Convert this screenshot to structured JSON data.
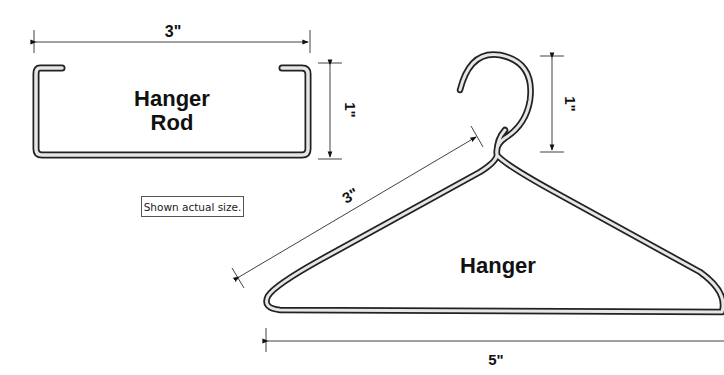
{
  "rod": {
    "title_line1": "Hanger",
    "title_line2": "Rod",
    "width_dim": "3\"",
    "height_dim": "1\""
  },
  "hanger": {
    "title": "Hanger",
    "diagonal_dim": "3\"",
    "height_dim": "1\"",
    "width_dim": "5\""
  },
  "note": "Shown actual size."
}
